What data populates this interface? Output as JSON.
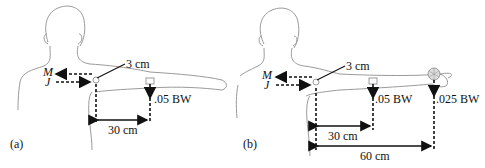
{
  "panels": [
    {
      "id": "a",
      "label": "(a)",
      "joint_offset": "3 cm",
      "force_labels": {
        "muscle": "M",
        "joint": "J"
      },
      "weights": [
        {
          "label": ".05 BW",
          "distance": "30 cm"
        }
      ]
    },
    {
      "id": "b",
      "label": "(b)",
      "joint_offset": "3 cm",
      "force_labels": {
        "muscle": "M",
        "joint": "J"
      },
      "weights": [
        {
          "label": ".05 BW",
          "distance": "30 cm"
        },
        {
          "label": ".025 BW",
          "distance": "60 cm"
        }
      ]
    }
  ],
  "colors": {
    "outline": "#9a9a9a",
    "ink": "#111111"
  }
}
